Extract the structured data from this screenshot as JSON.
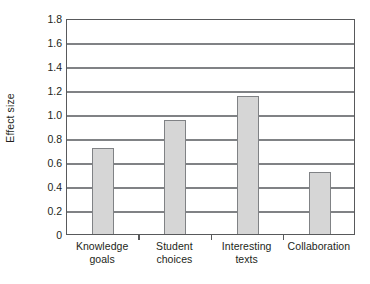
{
  "chart_data": {
    "type": "bar",
    "title": "",
    "xlabel": "",
    "ylabel": "Effect size",
    "categories": [
      "Knowledge goals",
      "Student choices",
      "Interesting texts",
      "Collaboration"
    ],
    "category_lines": [
      [
        "Knowledge",
        "goals"
      ],
      [
        "Student",
        "choices"
      ],
      [
        "Interesting",
        "texts"
      ],
      [
        "Collaboration",
        ""
      ]
    ],
    "values": [
      0.72,
      0.95,
      1.15,
      0.52
    ],
    "ylim": [
      0,
      1.8
    ],
    "ytick_labels": [
      "1.8",
      "1.6",
      "1.4",
      "1.2",
      "1.0",
      "0.8",
      "0.6",
      "0.4",
      "0.2",
      "0"
    ],
    "ytick_values": [
      1.8,
      1.6,
      1.4,
      1.2,
      1.0,
      0.8,
      0.6,
      0.4,
      0.2,
      0
    ],
    "grid": true,
    "grid_axis": "y",
    "legend": false,
    "legend_position": "none",
    "colors": {
      "bar_fill": "#d6d6d6",
      "bar_stroke": "#808285",
      "gridline": "#808285",
      "frame": "#58595b",
      "text": "#231f20",
      "background": "#ffffff"
    }
  }
}
